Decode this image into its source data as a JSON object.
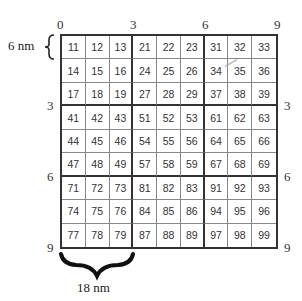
{
  "diagram": {
    "title": "",
    "top_axis": [
      "0",
      "3",
      "6",
      "9"
    ],
    "left_axis": [
      "3",
      "6",
      "9"
    ],
    "right_axis": [
      "3",
      "6",
      "9"
    ],
    "row_height_label": "6 nm",
    "block_width_label": "18 nm",
    "grid_rows": [
      [
        "11",
        "12",
        "13",
        "21",
        "22",
        "23",
        "31",
        "32",
        "33"
      ],
      [
        "14",
        "15",
        "16",
        "24",
        "25",
        "26",
        "34",
        "35",
        "36"
      ],
      [
        "17",
        "18",
        "19",
        "27",
        "28",
        "29",
        "37",
        "38",
        "39"
      ],
      [
        "41",
        "42",
        "43",
        "51",
        "52",
        "53",
        "61",
        "62",
        "63"
      ],
      [
        "44",
        "45",
        "46",
        "54",
        "55",
        "56",
        "64",
        "65",
        "66"
      ],
      [
        "47",
        "48",
        "49",
        "57",
        "58",
        "59",
        "67",
        "68",
        "69"
      ],
      [
        "71",
        "72",
        "73",
        "81",
        "82",
        "83",
        "91",
        "92",
        "93"
      ],
      [
        "74",
        "75",
        "76",
        "84",
        "85",
        "86",
        "94",
        "95",
        "96"
      ],
      [
        "77",
        "78",
        "79",
        "87",
        "88",
        "89",
        "97",
        "98",
        "99"
      ]
    ],
    "colors": {
      "major_line": "#333333",
      "minor_line": "#888888",
      "text": "#333333"
    }
  }
}
